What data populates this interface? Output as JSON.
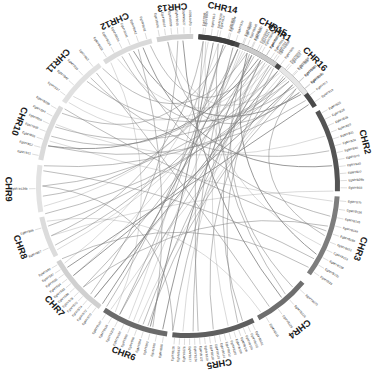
{
  "figure": {
    "type": "circos-synteny-plot",
    "title": "",
    "background_color": "#ffffff",
    "link_color": "#808080",
    "center": {
      "x": 188,
      "y": 186
    },
    "ring_outer_radius": 152,
    "ring_inner_radius": 147
  },
  "chromosomes": [
    {
      "name": "CHR1",
      "color": "#4a4a4a",
      "start_angle": -86,
      "end_angle": -32,
      "label_angle": -59,
      "label_radius": 178,
      "genes": [
        "EgMYB86",
        "EgMYB13",
        "EgMYB14",
        "EgMYB05",
        "EgMYB16",
        "EgMYB97",
        "EgMYB20",
        "EgMYB21",
        "EgMYB23",
        "EgMYB24",
        "EgMYB06",
        "EgMYB07",
        "EgMYB08",
        "EgMYB10",
        "EgMYB12",
        "EgMYB17",
        "EgMYB19"
      ]
    },
    {
      "name": "CHR2",
      "color": "#545454",
      "start_angle": -30,
      "end_angle": 2,
      "label_angle": -14,
      "label_radius": 182,
      "genes": [
        "EgMYB25",
        "EgMYB26",
        "EgMYB28",
        "EgMYB29",
        "EgMYB31",
        "EgMYB34",
        "EgMYB30",
        "EgMYB75",
        "EgMYB40",
        "EgMYB22",
        "EgMYB29b",
        "EgMYB33"
      ]
    },
    {
      "name": "CHR3",
      "color": "#7d7d7d",
      "start_angle": 4,
      "end_angle": 36,
      "label_angle": 20,
      "label_radius": 183,
      "genes": [
        "EgMYB79",
        "EgMYB136",
        "EgMYB145",
        "EgMYB149",
        "EgMYB160",
        "EgMYB151",
        "EgMYB153",
        "EgMYB158",
        "EgMYB130",
        "EgMYB33"
      ]
    },
    {
      "name": "CHR4",
      "color": "#6e6e6e",
      "start_angle": 40,
      "end_angle": 62,
      "label_angle": 52,
      "label_radius": 181,
      "genes": [
        "EgMYB123",
        "EgMYB126",
        "EgMYB129",
        "EgMYB131"
      ]
    },
    {
      "name": "CHR5",
      "color": "#5e5e5e",
      "start_angle": 64,
      "end_angle": 96,
      "label_angle": 80,
      "label_radius": 180,
      "genes": [
        "EgMYB101",
        "EgMYB102",
        "EgMYB104",
        "EgMYB106",
        "EgMYB108",
        "EgMYB110",
        "EgMYB112",
        "EgMYB114",
        "EgMYB116",
        "EgMYB118",
        "EgMYB120",
        "EgMYB122",
        "EgMYB124",
        "EgMYB127",
        "EgMYB128",
        "EgMYB132",
        "EgMYB135"
      ]
    },
    {
      "name": "CHR6",
      "color": "#6a6a6a",
      "start_angle": 98,
      "end_angle": 124,
      "label_angle": 111,
      "label_radius": 180,
      "genes": [
        "EgMYB88",
        "EgMYB90",
        "EgMYB92",
        "EgMYB94",
        "EgMYB96",
        "EgMYB98",
        "EgMYB100",
        "EgMYB103",
        "EgMYB105",
        "EgMYB107"
      ]
    },
    {
      "name": "CHR7",
      "color": "#d0d0d0",
      "start_angle": 126,
      "end_angle": 150,
      "label_angle": 138,
      "label_radius": 180,
      "genes": [
        "EgMYB70",
        "EgMYB72",
        "EgMYB74",
        "EgMYB76",
        "EgMYB78",
        "EgMYB80",
        "EgMYB82",
        "EgMYB84",
        "EgMYB85",
        "EgMYB87",
        "EgMYB89"
      ]
    },
    {
      "name": "CHR8",
      "color": "#dcdcdc",
      "start_angle": 152,
      "end_angle": 168,
      "label_angle": 160,
      "label_radius": 179,
      "genes": [
        "EgMYB67",
        "EgMYB66"
      ]
    },
    {
      "name": "CHR9",
      "color": "#e2e2e2",
      "start_angle": 170,
      "end_angle": 188,
      "label_angle": 179,
      "label_radius": 180,
      "genes": [
        "EgMYB126b"
      ]
    },
    {
      "name": "CHR10",
      "color": "#dadada",
      "start_angle": 190,
      "end_angle": 212,
      "label_angle": 201,
      "label_radius": 181,
      "genes": [
        "EgMYB11",
        "EgMYB52",
        "EgMYB55",
        "EgMYB58",
        "EgMYB60",
        "EgMYB64",
        "EgMYB29b"
      ]
    },
    {
      "name": "CHR11",
      "color": "#e0e0e0",
      "start_angle": 214,
      "end_angle": 234,
      "label_angle": 224,
      "label_radius": 181,
      "genes": [
        "EgMYB37",
        "EgMYB42",
        "EgMYB35",
        "EgMYB63"
      ]
    },
    {
      "name": "CHR12",
      "color": "#dadada",
      "start_angle": 236,
      "end_angle": 256,
      "label_angle": 246,
      "label_radius": 181,
      "genes": [
        "EgMYB018",
        "EgMYB024",
        "EgMYB036",
        "EgMYB041",
        "EgMYB042",
        "EgMYB062"
      ]
    },
    {
      "name": "CHR13",
      "color": "#cfcfcf",
      "start_angle": 258,
      "end_angle": 272,
      "label_angle": 265,
      "label_radius": 180,
      "genes": [
        "EgMYB001",
        "EgMYB007",
        "EgMYB009",
        "EgMYB015",
        "EgMYB027",
        "EgMYB029"
      ]
    },
    {
      "name": "CHR14",
      "color": "#3f3f3f",
      "start_angle": 274,
      "end_angle": 288,
      "label_angle": 281,
      "label_radius": 181,
      "genes": [
        "EgMYB005",
        "EgMYB008",
        "EgMYB044"
      ]
    },
    {
      "name": "CHR15",
      "color": "#cacaca",
      "start_angle": 290,
      "end_angle": 306,
      "label_angle": 298,
      "label_radius": 180,
      "genes": [
        "EgMYB043",
        "EgMYB045",
        "EgMYB047",
        "EgMYB049",
        "EgMYB050",
        "EgMYB051",
        "EgMYB053",
        "EgMYB056"
      ]
    },
    {
      "name": "CHR16",
      "color": "#e6e6e6",
      "start_angle": 308,
      "end_angle": 322,
      "label_angle": 315,
      "label_radius": 179,
      "genes": [
        "EgMYB057",
        "EgMYB059",
        "EgMYB061",
        "EgMYB065"
      ]
    }
  ],
  "links": [
    {
      "a": -80,
      "b": 105,
      "curve": 0.18
    },
    {
      "a": -76,
      "b": 118,
      "curve": 0.16
    },
    {
      "a": -72,
      "b": 88,
      "curve": 0.22
    },
    {
      "a": -68,
      "b": 142,
      "curve": 0.12
    },
    {
      "a": -64,
      "b": 200,
      "curve": 0.14
    },
    {
      "a": -60,
      "b": 96,
      "curve": 0.25
    },
    {
      "a": -56,
      "b": 215,
      "curve": 0.12
    },
    {
      "a": -52,
      "b": 130,
      "curve": 0.2
    },
    {
      "a": -48,
      "b": 243,
      "curve": 0.1
    },
    {
      "a": -44,
      "b": 110,
      "curve": 0.22
    },
    {
      "a": -40,
      "b": 262,
      "curve": 0.1
    },
    {
      "a": -36,
      "b": 196,
      "curve": 0.16
    },
    {
      "a": -20,
      "b": 205,
      "curve": 0.12
    },
    {
      "a": -14,
      "b": 228,
      "curve": 0.12
    },
    {
      "a": -8,
      "b": 252,
      "curve": 0.1
    },
    {
      "a": 6,
      "b": 198,
      "curve": 0.14
    },
    {
      "a": 12,
      "b": 246,
      "curve": 0.1
    },
    {
      "a": 18,
      "b": 212,
      "curve": 0.12
    },
    {
      "a": 24,
      "b": 277,
      "curve": 0.1
    },
    {
      "a": 30,
      "b": 186,
      "curve": 0.16
    },
    {
      "a": 44,
      "b": 295,
      "curve": 0.1
    },
    {
      "a": 50,
      "b": 268,
      "curve": 0.12
    },
    {
      "a": 56,
      "b": 231,
      "curve": 0.14
    },
    {
      "a": 68,
      "b": 300,
      "curve": 0.12
    },
    {
      "a": 74,
      "b": 288,
      "curve": 0.14
    },
    {
      "a": 80,
      "b": 311,
      "curve": 0.1
    },
    {
      "a": 86,
      "b": 276,
      "curve": 0.16
    },
    {
      "a": 92,
      "b": 302,
      "curve": 0.14
    },
    {
      "a": 100,
      "b": 296,
      "curve": 0.16
    },
    {
      "a": 106,
      "b": 318,
      "curve": 0.12
    },
    {
      "a": 112,
      "b": 291,
      "curve": 0.18
    },
    {
      "a": 118,
      "b": 305,
      "curve": 0.14
    },
    {
      "a": 124,
      "b": 284,
      "curve": 0.2
    },
    {
      "a": 130,
      "b": 310,
      "curve": 0.14
    },
    {
      "a": 136,
      "b": 297,
      "curve": 0.18
    },
    {
      "a": 142,
      "b": 316,
      "curve": 0.14
    },
    {
      "a": 148,
      "b": 282,
      "curve": 0.22
    },
    {
      "a": 156,
      "b": 300,
      "curve": 0.2
    },
    {
      "a": 164,
      "b": 312,
      "curve": 0.18
    },
    {
      "a": 172,
      "b": 293,
      "curve": 0.24
    },
    {
      "a": 180,
      "b": 308,
      "curve": 0.22
    },
    {
      "a": 188,
      "b": 320,
      "curve": 0.2
    },
    {
      "a": 196,
      "b": 299,
      "curve": 0.26
    },
    {
      "a": 204,
      "b": 314,
      "curve": 0.24
    },
    {
      "a": 210,
      "b": 285,
      "curve": 0.3
    },
    {
      "a": 218,
      "b": 303,
      "curve": 0.28
    },
    {
      "a": 226,
      "b": 317,
      "curve": 0.26
    },
    {
      "a": 234,
      "b": 294,
      "curve": 0.32
    },
    {
      "a": 241,
      "b": 309,
      "curve": 0.3
    },
    {
      "a": 248,
      "b": 321,
      "curve": 0.28
    },
    {
      "a": 255,
      "b": 301,
      "curve": 0.34
    },
    {
      "a": 262,
      "b": 313,
      "curve": 0.32
    },
    {
      "a": -84,
      "b": 160,
      "curve": 0.14
    },
    {
      "a": -70,
      "b": 176,
      "curve": 0.14
    },
    {
      "a": -58,
      "b": 154,
      "curve": 0.18
    },
    {
      "a": -46,
      "b": 169,
      "curve": 0.16
    },
    {
      "a": -34,
      "b": 146,
      "curve": 0.2
    },
    {
      "a": 2,
      "b": 160,
      "curve": 0.18
    },
    {
      "a": 16,
      "b": 136,
      "curve": 0.22
    },
    {
      "a": 34,
      "b": 150,
      "curve": 0.2
    },
    {
      "a": 60,
      "b": 166,
      "curve": 0.2
    },
    {
      "a": 96,
      "b": 180,
      "curve": 0.22
    },
    {
      "a": -78,
      "b": 48,
      "curve": 0.26
    },
    {
      "a": -66,
      "b": 28,
      "curve": 0.3
    },
    {
      "a": -54,
      "b": 70,
      "curve": 0.24
    },
    {
      "a": -42,
      "b": 20,
      "curve": 0.34
    },
    {
      "a": 238,
      "b": 120,
      "curve": 0.24
    },
    {
      "a": 250,
      "b": 104,
      "curve": 0.26
    },
    {
      "a": 266,
      "b": 132,
      "curve": 0.24
    },
    {
      "a": 278,
      "b": 114,
      "curve": 0.28
    },
    {
      "a": 290,
      "b": 126,
      "curve": 0.26
    },
    {
      "a": 304,
      "b": 108,
      "curve": 0.3
    },
    {
      "a": 316,
      "b": 122,
      "curve": 0.28
    }
  ]
}
